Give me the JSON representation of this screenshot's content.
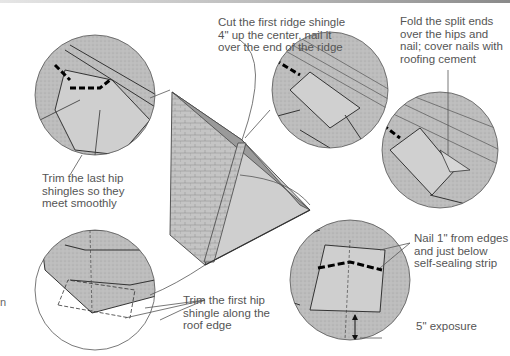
{
  "diagram": {
    "colors": {
      "shingle_fill": "#b9b9b9",
      "line": "#3a3a3a",
      "text": "#555555",
      "nail_mark": "#111111"
    },
    "callouts": [
      {
        "id": "cut-ridge",
        "text": "Cut the first ridge shingle\n4\" up the center, nail it\nover the end of the ridge"
      },
      {
        "id": "fold-split",
        "text": "Fold the split ends\nover the hips and\nnail; cover nails with\nroofing cement"
      },
      {
        "id": "trim-last",
        "text": "Trim the last hip\nshingles so they\nmeet smoothly"
      },
      {
        "id": "trim-first",
        "text": "Trim the first hip\nshingle along the\nroof edge"
      },
      {
        "id": "nail",
        "text": "Nail 1\" from edges\nand just below\nself-sealing strip"
      },
      {
        "id": "exposure",
        "text": "5\" exposure"
      }
    ],
    "stray_char": "n"
  }
}
